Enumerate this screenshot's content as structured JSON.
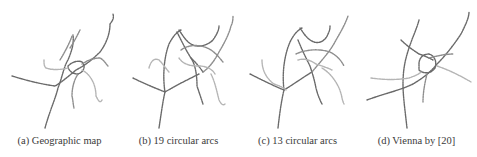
{
  "figure": {
    "panels": [
      {
        "id": "a",
        "caption": "(a) Geographic map"
      },
      {
        "id": "b",
        "caption": "(b) 19 circular arcs"
      },
      {
        "id": "c",
        "caption": "(c) 13 circular arcs"
      },
      {
        "id": "d",
        "caption": "(d) Vienna by [20]"
      }
    ]
  }
}
